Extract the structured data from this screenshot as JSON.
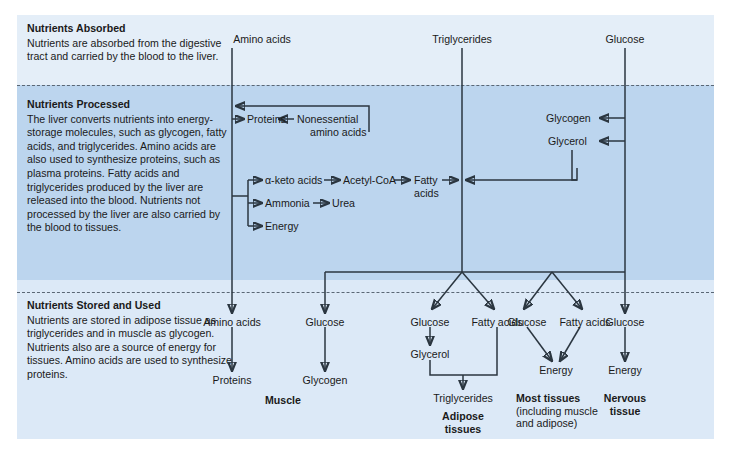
{
  "figure": {
    "colors": {
      "band_absorbed": "#e4eef8",
      "band_processed": "#bcd5ee",
      "band_stored": "#dce9f7",
      "line": "#2b3640",
      "dash": "#5a6775",
      "text": "#1a1a1a"
    }
  },
  "bands": [
    {
      "id": "absorbed",
      "heading": "Nutrients Absorbed",
      "body": "Nutrients are absorbed from the digestive tract and carried by the blood to the liver."
    },
    {
      "id": "processed",
      "heading": "Nutrients Processed",
      "body": "The liver converts nutrients into energy-storage molecules, such as glycogen, fatty acids, and triglycerides. Amino acids are also used to synthesize proteins, such as plasma proteins. Fatty acids and triglycerides produced by the liver are released into the blood. Nutrients not processed by the liver are also carried by the blood to tissues."
    },
    {
      "id": "stored",
      "heading": "Nutrients Stored and Used",
      "body": "Nutrients are stored in adipose tissue as triglycerides and in muscle as glycogen. Nutrients also are a source of energy for tissues. Amino acids are used to synthesize proteins."
    }
  ],
  "inputs": [
    {
      "label": "Amino acids"
    },
    {
      "label": "Triglycerides"
    },
    {
      "label": "Glucose"
    }
  ],
  "processed_nodes": [
    {
      "label": "Proteins"
    },
    {
      "label": "Nonessential"
    },
    {
      "label": "amino acids"
    },
    {
      "label": "α-keto acids"
    },
    {
      "label": "Acetyl-CoA"
    },
    {
      "label": "Fatty"
    },
    {
      "label": "acids"
    },
    {
      "label": "Ammonia"
    },
    {
      "label": "Urea"
    },
    {
      "label": "Energy"
    },
    {
      "label": "Glycogen"
    },
    {
      "label": "Glycerol"
    }
  ],
  "stored_groups": [
    {
      "id": "muscle",
      "title": "Muscle",
      "subtitle": "",
      "nodes": [
        {
          "label": "Amino acids"
        },
        {
          "label": "Glucose"
        },
        {
          "label": "Proteins"
        },
        {
          "label": "Glycogen"
        }
      ]
    },
    {
      "id": "adipose",
      "title": "Adipose",
      "title2": "tissues",
      "subtitle": "",
      "nodes": [
        {
          "label": "Glucose"
        },
        {
          "label": "Fatty acids"
        },
        {
          "label": "Glycerol"
        },
        {
          "label": "Triglycerides"
        }
      ]
    },
    {
      "id": "most-tissues",
      "title": "Most tissues",
      "subtitle": "(including muscle and adipose)",
      "nodes": [
        {
          "label": "Glucose"
        },
        {
          "label": "Fatty acids"
        },
        {
          "label": "Energy"
        }
      ]
    },
    {
      "id": "nervous",
      "title": "Nervous",
      "title2": "tissue",
      "subtitle": "",
      "nodes": [
        {
          "label": "Glucose"
        },
        {
          "label": "Energy"
        }
      ]
    }
  ],
  "labels": {
    "amino_acids_top": "Amino acids",
    "triglycerides_top": "Triglycerides",
    "glucose_top": "Glucose",
    "proteins_mid": "Proteins",
    "nonessential": "Nonessential",
    "amino_acids_2": "amino acids",
    "keto_acids": "α-keto acids",
    "acetyl_coa": "Acetyl-CoA",
    "fatty_1": "Fatty",
    "fatty_2": "acids",
    "ammonia": "Ammonia",
    "urea": "Urea",
    "energy_mid": "Energy",
    "glycogen_mid": "Glycogen",
    "glycerol_mid": "Glycerol",
    "b_amino_acids": "Amino acids",
    "b_glucose_1": "Glucose",
    "b_proteins": "Proteins",
    "b_glycogen": "Glycogen",
    "b_muscle": "Muscle",
    "b_glucose_2": "Glucose",
    "b_fatty_1": "Fatty acids",
    "b_glycerol": "Glycerol",
    "b_triglycerides": "Triglycerides",
    "b_adipose_1": "Adipose",
    "b_adipose_2": "tissues",
    "b_glucose_3": "Glucose",
    "b_fatty_2": "Fatty acids",
    "b_energy_1": "Energy",
    "b_most_tissues": "Most tissues",
    "b_most_sub": "(including muscle and adipose)",
    "b_glucose_4": "Glucose",
    "b_energy_2": "Energy",
    "b_nervous_1": "Nervous",
    "b_nervous_2": "tissue"
  }
}
